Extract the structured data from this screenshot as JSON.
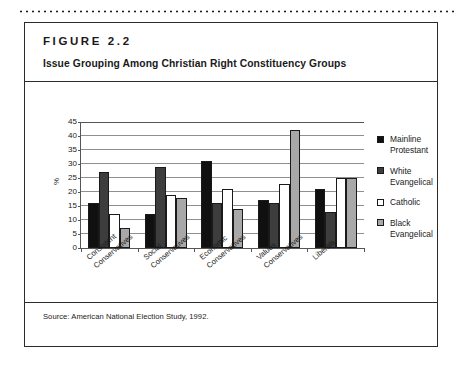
{
  "figure": {
    "number": "FIGURE 2.2",
    "title": "Issue Grouping Among Christian Right Constituency Groups",
    "source": "Source: American National Election Study, 1992."
  },
  "chart_data": {
    "type": "bar",
    "title": "Issue Grouping Among Christian Right Constituency Groups",
    "xlabel": "",
    "ylabel": "%",
    "ylim": [
      0,
      45
    ],
    "yticks": [
      0,
      5,
      10,
      15,
      20,
      25,
      30,
      35,
      40,
      45
    ],
    "grid": true,
    "legend_position": "right",
    "categories": [
      "Consistent\nConservatives",
      "Social\nConservatives",
      "Economic\nConservatives",
      "Values\nConservatives",
      "Liberals"
    ],
    "series": [
      {
        "name": "Mainline\nProtestant",
        "color": "#101010",
        "values": [
          16,
          12,
          31,
          17,
          21
        ]
      },
      {
        "name": "White\nEvangelical",
        "color": "#3d3d3d",
        "values": [
          27,
          29,
          16,
          16,
          13
        ]
      },
      {
        "name": "Catholic",
        "color": "#ffffff",
        "values": [
          12,
          19,
          21,
          23,
          25
        ]
      },
      {
        "name": "Black\nEvangelical",
        "color": "#a8a8a8",
        "values": [
          7,
          18,
          14,
          42,
          25
        ]
      }
    ]
  }
}
